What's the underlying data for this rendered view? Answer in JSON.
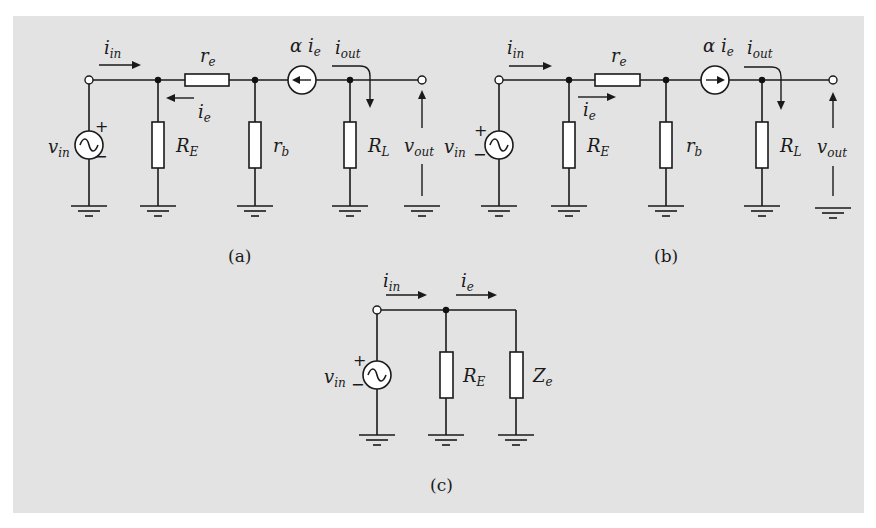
{
  "figure": {
    "panels": [
      {
        "id": "a",
        "caption": "(a)",
        "source": {
          "label": "v",
          "sub": "in",
          "plus": "+",
          "minus": "−"
        },
        "input_current": {
          "label": "i",
          "sub": "in"
        },
        "emitter_current": {
          "label": "i",
          "sub": "e",
          "direction": "left"
        },
        "components": [
          {
            "name": "R",
            "sub": "E",
            "type": "resistor",
            "orientation": "vertical"
          },
          {
            "name": "r",
            "sub": "e",
            "type": "resistor",
            "orientation": "horizontal"
          },
          {
            "name": "r",
            "sub": "b",
            "type": "resistor",
            "orientation": "vertical"
          },
          {
            "name": "R",
            "sub": "L",
            "type": "resistor",
            "orientation": "vertical"
          }
        ],
        "current_source": {
          "label": "α i",
          "sub": "e",
          "direction": "left"
        },
        "output_current": {
          "label": "i",
          "sub": "out"
        },
        "output_voltage": {
          "label": "v",
          "sub": "out"
        }
      },
      {
        "id": "b",
        "caption": "(b)",
        "source": {
          "label": "v",
          "sub": "in",
          "plus": "+",
          "minus": "−"
        },
        "input_current": {
          "label": "i",
          "sub": "in"
        },
        "emitter_current": {
          "label": "i",
          "sub": "e",
          "direction": "right"
        },
        "components": [
          {
            "name": "R",
            "sub": "E",
            "type": "resistor",
            "orientation": "vertical"
          },
          {
            "name": "r",
            "sub": "e",
            "type": "resistor",
            "orientation": "horizontal"
          },
          {
            "name": "r",
            "sub": "b",
            "type": "resistor",
            "orientation": "vertical"
          },
          {
            "name": "R",
            "sub": "L",
            "type": "resistor",
            "orientation": "vertical"
          }
        ],
        "current_source": {
          "label": "α i",
          "sub": "e",
          "direction": "right"
        },
        "output_current": {
          "label": "i",
          "sub": "out"
        },
        "output_voltage": {
          "label": "v",
          "sub": "out"
        }
      },
      {
        "id": "c",
        "caption": "(c)",
        "source": {
          "label": "v",
          "sub": "in",
          "plus": "+",
          "minus": "−"
        },
        "input_current": {
          "label": "i",
          "sub": "in"
        },
        "emitter_current": {
          "label": "i",
          "sub": "e",
          "direction": "right"
        },
        "components": [
          {
            "name": "R",
            "sub": "E",
            "type": "resistor",
            "orientation": "vertical"
          },
          {
            "name": "Z",
            "sub": "e",
            "type": "impedance",
            "orientation": "vertical"
          }
        ]
      }
    ]
  }
}
